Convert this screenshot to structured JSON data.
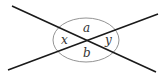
{
  "diagram": {
    "type": "intersecting-lines-angles",
    "labels": {
      "top": "a",
      "bottom": "b",
      "left": "x",
      "right": "y"
    },
    "line_color": "#1a1a1a",
    "circle_color": "#777777"
  }
}
